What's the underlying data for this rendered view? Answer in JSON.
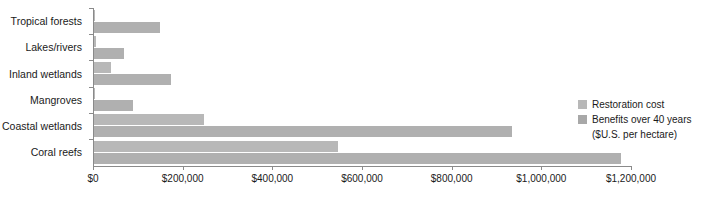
{
  "chart_data": {
    "type": "bar",
    "orientation": "horizontal",
    "title": "",
    "subtitle": "",
    "xlabel": "",
    "ylabel": "",
    "xlim": [
      0,
      1200000
    ],
    "grid": false,
    "legend_position": "right",
    "categories": [
      "Tropical forests",
      "Lakes/rivers",
      "Inland wetlands",
      "Mangroves",
      "Coastal wetlands",
      "Coral reefs"
    ],
    "series": [
      {
        "name": "Restoration cost",
        "color": "#b8b8b8",
        "values": [
          2000,
          4000,
          38000,
          2500,
          245000,
          545000
        ]
      },
      {
        "name": "Benefits over 40 years",
        "color": "#b0b0b0",
        "values": [
          148000,
          68000,
          172000,
          88000,
          932000,
          1175000
        ]
      }
    ],
    "tick_labels": [
      "$0",
      "$200,000",
      "$400,000",
      "$600,000",
      "$800,000",
      "$1,000,000",
      "$1,200,000"
    ],
    "tick_values": [
      0,
      200000,
      400000,
      600000,
      800000,
      1000000,
      1200000
    ],
    "units_note": "($U.S. per hectare)"
  },
  "legend": {
    "items": [
      {
        "label": "Restoration cost"
      },
      {
        "label": "Benefits over 40 years"
      }
    ],
    "sub_label": "($U.S. per hectare)"
  }
}
